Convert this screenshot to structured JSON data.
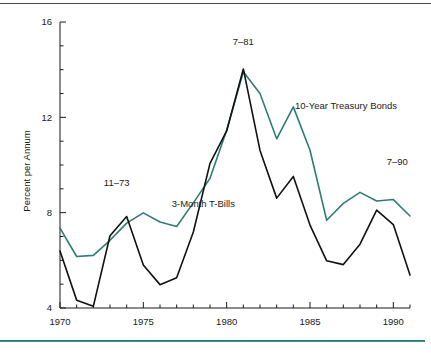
{
  "figure": {
    "background": "#ffffff",
    "top_rule_color": "#4a4a4a",
    "bottom_rule_color": "#2e7d75"
  },
  "chart_data": {
    "type": "line",
    "title": "",
    "subtitle": "",
    "xlabel": "",
    "ylabel": "Percent per Annum",
    "xlim": [
      1970,
      1991
    ],
    "ylim": [
      4,
      16
    ],
    "ytick_values": [
      4,
      8,
      12,
      16
    ],
    "ytick_labels": [
      "4",
      "8",
      "12",
      "16"
    ],
    "yminor_step": 1,
    "xtick_values": [
      1970,
      1971,
      1972,
      1973,
      1974,
      1975,
      1976,
      1977,
      1978,
      1979,
      1980,
      1981,
      1982,
      1983,
      1984,
      1985,
      1986,
      1987,
      1988,
      1989,
      1990,
      1991
    ],
    "xtick_labeled": [
      1970,
      1975,
      1980,
      1985,
      1990
    ],
    "xtick_labels": [
      "1970",
      "1975",
      "1980",
      "1985",
      "1990"
    ],
    "grid": false,
    "legend_position": "inline-annotations",
    "x": [
      1970,
      1971,
      1972,
      1973,
      1974,
      1975,
      1976,
      1977,
      1978,
      1979,
      1980,
      1981,
      1982,
      1983,
      1984,
      1985,
      1986,
      1987,
      1988,
      1989,
      1990,
      1991
    ],
    "series": [
      {
        "name": "10-Year Treasury Bonds",
        "color": "#2e7d75",
        "values": [
          7.35,
          6.16,
          6.21,
          6.84,
          7.56,
          7.99,
          7.61,
          7.42,
          8.41,
          9.44,
          11.46,
          13.91,
          13.0,
          11.1,
          12.44,
          10.62,
          7.68,
          8.39,
          8.85,
          8.49,
          8.55,
          7.86
        ]
      },
      {
        "name": "3-Month T-Bills",
        "color": "#111111",
        "values": [
          6.39,
          4.33,
          4.07,
          7.03,
          7.84,
          5.8,
          4.98,
          5.27,
          7.19,
          10.07,
          11.43,
          14.03,
          10.61,
          8.61,
          9.52,
          7.48,
          5.98,
          5.82,
          6.68,
          8.11,
          7.5,
          5.38
        ]
      }
    ],
    "annotations": [
      {
        "text": "11–73",
        "x": 1973.4,
        "y": 9.1,
        "name": "annotation-11-73"
      },
      {
        "text": "7–81",
        "x": 1981.0,
        "y": 15.05,
        "name": "annotation-7-81"
      },
      {
        "text": "7–90",
        "x": 1989.6,
        "y": 10.0,
        "name": "annotation-7-90"
      },
      {
        "text": "10-Year Treasury Bonds",
        "x": 1984.1,
        "y": 12.35,
        "name": "series-label-bonds"
      },
      {
        "text": "3-Month T-Bills",
        "x": 1978.6,
        "y": 8.25,
        "name": "series-label-tbills"
      }
    ]
  }
}
